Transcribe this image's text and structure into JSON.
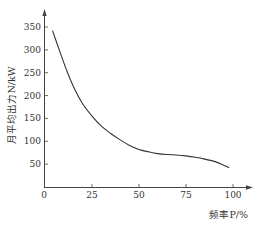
{
  "chart_data": {
    "type": "line",
    "title": "",
    "xlabel": "频率P/%",
    "ylabel": "月平均出力N/kW",
    "xlim": [
      0,
      100
    ],
    "ylim": [
      0,
      350
    ],
    "x_ticks": [
      "0",
      "25",
      "50",
      "75",
      "100"
    ],
    "y_ticks": [
      "50",
      "100",
      "150",
      "200",
      "250",
      "300",
      "350"
    ],
    "grid": false,
    "legend": null,
    "series": [
      {
        "name": "月平均出力",
        "x": [
          4,
          8,
          12,
          16,
          20,
          25,
          30,
          35,
          40,
          45,
          50,
          55,
          60,
          65,
          70,
          75,
          80,
          85,
          90,
          94,
          98
        ],
        "y": [
          342,
          295,
          250,
          212,
          182,
          155,
          133,
          117,
          103,
          91,
          82,
          77,
          73,
          71,
          70,
          68,
          65,
          61,
          56,
          50,
          42
        ]
      }
    ]
  }
}
